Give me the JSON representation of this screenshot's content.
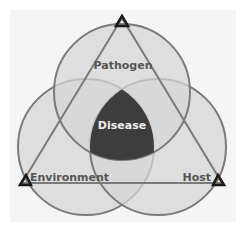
{
  "diagram": {
    "type": "disease-triangle-venn",
    "labels": {
      "pathogen": "Pathogen",
      "environment": "Environment",
      "host": "Host",
      "center": "Disease"
    },
    "colors": {
      "background": "#f5f5f5",
      "circle_fill": "#d4d4d4",
      "circle_stroke": "#7a7a7a",
      "triangle_stroke": "#7a7a7a",
      "triangle_vertex": "#1a1a1a",
      "disease_fill": "#3d3d3d",
      "label_text": "#555555",
      "center_text": "#f0f0f0"
    }
  }
}
